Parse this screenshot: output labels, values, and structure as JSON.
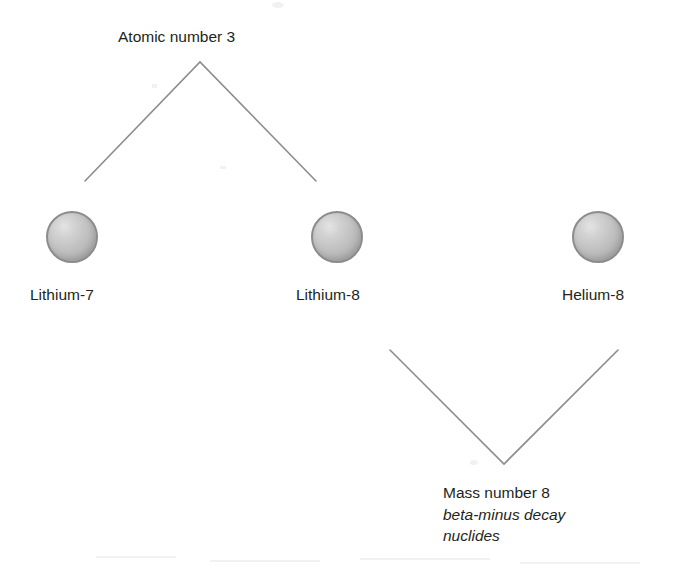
{
  "diagram": {
    "background_color": "#ffffff",
    "line_color": "#8c8c8c",
    "text_color": "#231f20",
    "sphere_fill_color": "#c2c2c2",
    "sphere_border_color": "#8c8c8c",
    "nodes": [
      {
        "id": "lithium-7",
        "label": "Lithium-7",
        "icon": "nuclide-sphere-icon"
      },
      {
        "id": "lithium-8",
        "label": "Lithium-8",
        "icon": "nuclide-sphere-icon"
      },
      {
        "id": "helium-8",
        "label": "Helium-8",
        "icon": "nuclide-sphere-icon"
      }
    ],
    "groups": [
      {
        "id": "atomic-number-group",
        "label": "Atomic number 3",
        "bracket": "inverted-v",
        "members": [
          "lithium-7",
          "lithium-8"
        ]
      },
      {
        "id": "mass-number-group",
        "bracket": "v",
        "members": [
          "lithium-8",
          "helium-8"
        ],
        "label_lines": [
          {
            "text": "Mass number 8",
            "style": "normal"
          },
          {
            "text": "beta-minus decay",
            "style": "italic"
          },
          {
            "text": "nuclides",
            "style": "italic"
          }
        ]
      }
    ],
    "annotations": {
      "mass_number_line1": "Mass number 8",
      "mass_number_line2": "beta-minus decay",
      "mass_number_line3": "nuclides"
    }
  }
}
